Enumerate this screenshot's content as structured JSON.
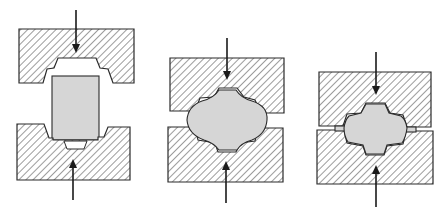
{
  "diagram": {
    "title": "",
    "colors": {
      "die_hatch": "#3a3a3a",
      "workpiece": "#d6d6d6",
      "outline": "#2a2a2a",
      "background": "#ffffff"
    },
    "stages": [
      {
        "id": "stage-1",
        "description": "billet placed between open dies",
        "force": "upper and lower dies pressing"
      },
      {
        "id": "stage-2",
        "description": "billet deformed, filling die cavity",
        "force": "upper and lower dies pressing"
      },
      {
        "id": "stage-3",
        "description": "dies closed, flash formed at parting line",
        "force": "upper and lower dies pressing"
      }
    ]
  }
}
